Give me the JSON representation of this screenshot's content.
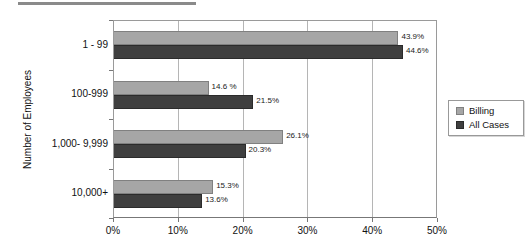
{
  "page": {
    "background": "#ffffff",
    "top_rule_color": "#8a8a8a"
  },
  "chart_data": {
    "type": "bar",
    "orientation": "horizontal",
    "title": "",
    "ylabel": "Number of Employees",
    "xlabel": "",
    "xlim": [
      0,
      50
    ],
    "xticks": [
      "0%",
      "10%",
      "20%",
      "30%",
      "40%",
      "50%"
    ],
    "grid": true,
    "legend_position": "right",
    "categories": [
      "1 - 99",
      "100-999",
      "1,000- 9,999",
      "10,000+"
    ],
    "series": [
      {
        "name": "Billing",
        "color": "#a6a6a6",
        "border_color": "#808080",
        "values": [
          43.9,
          14.6,
          26.1,
          15.3
        ],
        "labels": [
          "43.9%",
          "14.6 %",
          "26.1%",
          "15.3%"
        ]
      },
      {
        "name": "All Cases",
        "color": "#3f3f3f",
        "border_color": "#2b2b2b",
        "values": [
          44.6,
          21.5,
          20.3,
          13.6
        ],
        "labels": [
          "44.6%",
          "21.5%",
          "20.3%",
          "13.6%"
        ]
      }
    ]
  }
}
